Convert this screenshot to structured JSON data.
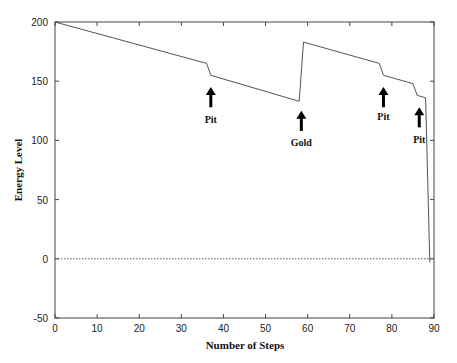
{
  "chart_data": {
    "type": "line",
    "title": "",
    "xlabel": "Number of Steps",
    "ylabel": "Energy Level",
    "xlim": [
      0,
      90
    ],
    "ylim": [
      -50,
      200
    ],
    "xticks": [
      0,
      10,
      20,
      30,
      40,
      50,
      60,
      70,
      80,
      90
    ],
    "yticks": [
      -50,
      0,
      50,
      100,
      150,
      200
    ],
    "grid": false,
    "legend": null,
    "series": [
      {
        "name": "Energy Level",
        "x": [
          0,
          36,
          37,
          58,
          59,
          77,
          78,
          85,
          86,
          88,
          89
        ],
        "y": [
          200,
          165,
          155,
          133,
          183,
          165,
          155,
          148,
          138,
          136,
          -3
        ]
      }
    ],
    "reference_lines": [
      {
        "type": "horizontal",
        "y": 0,
        "style": "dotted"
      }
    ],
    "annotations": [
      {
        "label": "Pit",
        "x": 37,
        "arrow_tip_y": 145,
        "arrow_tail_y": 128,
        "text_y": 115
      },
      {
        "label": "Gold",
        "x": 58.5,
        "arrow_tip_y": 125,
        "arrow_tail_y": 108,
        "text_y": 95
      },
      {
        "label": "Pit",
        "x": 78,
        "arrow_tip_y": 145,
        "arrow_tail_y": 128,
        "text_y": 117
      },
      {
        "label": "Pit",
        "x": 86.5,
        "arrow_tip_y": 128,
        "arrow_tail_y": 111,
        "text_y": 98
      }
    ]
  }
}
